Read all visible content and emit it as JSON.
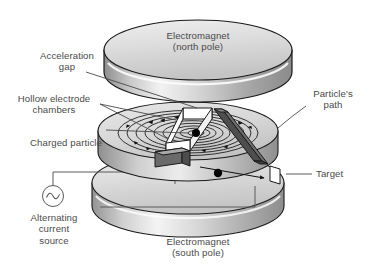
{
  "figure": {
    "background_color": "#ffffff",
    "text_color": "#4a4a4a"
  },
  "labels": {
    "north_magnet": "Electromagnet\n(north pole)",
    "south_magnet": "Electromagnet\n(south pole)",
    "acceleration_gap": "Acceleration\ngap",
    "hollow_electrode_chambers": "Hollow electrode\nchambers",
    "charged_particle": "Charged particle",
    "particles_path": "Particle's\npath",
    "target": "Target",
    "ac_source": "Alternating\ncurrent\nsource"
  },
  "components": {
    "top_disc_name": "electromagnet-north-pole-disc",
    "bottom_disc_name": "electromagnet-south-pole-disc",
    "dee_disc_name": "hollow-electrode-dee-assembly",
    "spiral_name": "particle-spiral-path",
    "target_name": "target-plate",
    "ac_symbol_name": "ac-source-symbol",
    "particle_center_name": "charged-particle-center",
    "particle_exit_name": "charged-particle-exit"
  },
  "colors": {
    "disc_top_light": "#e8e8e8",
    "disc_top_mid": "#cfcfcf",
    "disc_rim_dark": "#9a9a9a",
    "disc_rim_light": "#f0f0f0",
    "dee_fin_dark": "#575757",
    "outline": "#1a1a1a",
    "gap_white": "#ffffff",
    "wire": "#5a5a5a",
    "particle": "#000000"
  }
}
